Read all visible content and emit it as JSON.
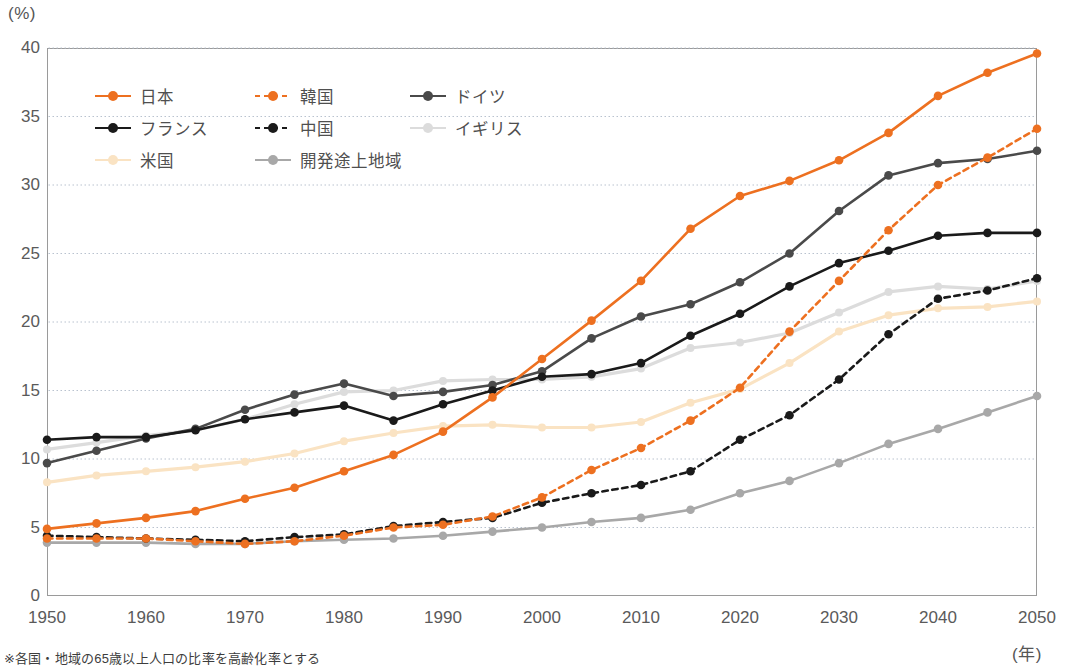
{
  "axis": {
    "y_unit": "(%)",
    "x_unit": "(年)",
    "y_ticks": [
      0,
      5,
      10,
      15,
      20,
      25,
      30,
      35,
      40
    ],
    "x_ticks": [
      1950,
      1960,
      1970,
      1980,
      1990,
      2000,
      2010,
      2020,
      2030,
      2040,
      2050
    ]
  },
  "footnote": "※各国・地域の65歳以上人口の比率を高齢化率とする",
  "legend": [
    {
      "label": "日本",
      "color": "#ED7020",
      "dash": false
    },
    {
      "label": "韓国",
      "color": "#ED7020",
      "dash": true
    },
    {
      "label": "ドイツ",
      "color": "#4a4a4a",
      "dash": false
    },
    {
      "label": "フランス",
      "color": "#1a1a1a",
      "dash": false
    },
    {
      "label": "中国",
      "color": "#1a1a1a",
      "dash": true
    },
    {
      "label": "イギリス",
      "color": "#dcdcdc",
      "dash": false
    },
    {
      "label": "米国",
      "color": "#fae3c3",
      "dash": false
    },
    {
      "label": "開発途上地域",
      "color": "#a8a8a8",
      "dash": false
    }
  ],
  "chart_data": {
    "type": "line",
    "title": "",
    "subtitle": "",
    "xlabel": "(年)",
    "ylabel": "(%)",
    "xlim": [
      1950,
      2050
    ],
    "ylim": [
      0,
      40
    ],
    "grid": "horizontal-dotted",
    "legend_position": "top-left-inside",
    "annotations": [
      "※各国・地域の65歳以上人口の比率を高齢化率とする"
    ],
    "x": [
      1950,
      1955,
      1960,
      1965,
      1970,
      1975,
      1980,
      1985,
      1990,
      1995,
      2000,
      2005,
      2010,
      2015,
      2020,
      2025,
      2030,
      2035,
      2040,
      2045,
      2050
    ],
    "series": [
      {
        "name": "日本",
        "color": "#ED7020",
        "style": "solid",
        "values": [
          4.9,
          5.3,
          5.7,
          6.2,
          7.1,
          7.9,
          9.1,
          10.3,
          12.0,
          14.5,
          17.3,
          20.1,
          23.0,
          26.8,
          29.2,
          30.3,
          31.8,
          33.8,
          36.5,
          38.2,
          39.6
        ]
      },
      {
        "name": "韓国",
        "color": "#ED7020",
        "style": "dashed",
        "values": [
          4.2,
          4.2,
          4.2,
          4.0,
          3.8,
          4.0,
          4.4,
          5.0,
          5.2,
          5.8,
          7.2,
          9.2,
          10.8,
          12.8,
          15.2,
          19.3,
          23.0,
          26.7,
          30.0,
          32.0,
          34.1
        ]
      },
      {
        "name": "ドイツ",
        "color": "#4a4a4a",
        "style": "solid",
        "values": [
          9.7,
          10.6,
          11.5,
          12.2,
          13.6,
          14.7,
          15.5,
          14.6,
          14.9,
          15.4,
          16.4,
          18.8,
          20.4,
          21.3,
          22.9,
          25.0,
          28.1,
          30.7,
          31.6,
          31.9,
          32.5
        ]
      },
      {
        "name": "フランス",
        "color": "#1a1a1a",
        "style": "solid",
        "values": [
          11.4,
          11.6,
          11.6,
          12.1,
          12.9,
          13.4,
          13.9,
          12.8,
          14.0,
          15.0,
          16.0,
          16.2,
          17.0,
          19.0,
          20.6,
          22.6,
          24.3,
          25.2,
          26.3,
          26.5,
          26.5
        ]
      },
      {
        "name": "中国",
        "color": "#1a1a1a",
        "style": "dashed",
        "values": [
          4.4,
          4.3,
          4.2,
          4.1,
          4.0,
          4.3,
          4.5,
          5.1,
          5.4,
          5.7,
          6.8,
          7.5,
          8.1,
          9.1,
          11.4,
          13.2,
          15.8,
          19.1,
          21.7,
          22.3,
          23.2
        ]
      },
      {
        "name": "イギリス",
        "color": "#dcdcdc",
        "style": "solid",
        "values": [
          10.7,
          11.2,
          11.7,
          12.1,
          12.9,
          14.0,
          14.9,
          15.0,
          15.7,
          15.8,
          15.8,
          16.0,
          16.6,
          18.1,
          18.5,
          19.2,
          20.7,
          22.2,
          22.6,
          22.4,
          23.0
        ]
      },
      {
        "name": "米国",
        "color": "#fae3c3",
        "style": "solid",
        "values": [
          8.3,
          8.8,
          9.1,
          9.4,
          9.8,
          10.4,
          11.3,
          11.9,
          12.4,
          12.5,
          12.3,
          12.3,
          12.7,
          14.1,
          15.1,
          17.0,
          19.3,
          20.5,
          21.0,
          21.1,
          21.5
        ]
      },
      {
        "name": "開発途上地域",
        "color": "#a8a8a8",
        "style": "solid",
        "values": [
          3.9,
          3.9,
          3.9,
          3.8,
          3.8,
          4.0,
          4.1,
          4.2,
          4.4,
          4.7,
          5.0,
          5.4,
          5.7,
          6.3,
          7.5,
          8.4,
          9.7,
          11.1,
          12.2,
          13.4,
          14.6
        ]
      }
    ]
  }
}
